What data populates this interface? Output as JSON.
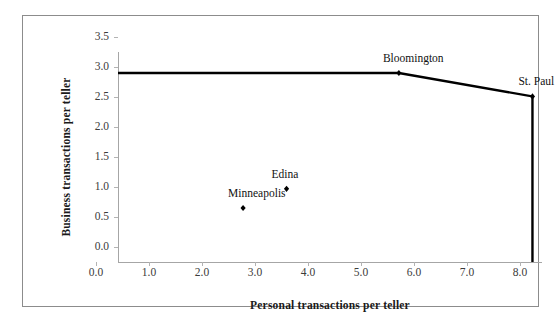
{
  "chart_data": {
    "type": "scatter",
    "title": "",
    "xlabel": "Personal transactions per teller",
    "ylabel": "Business transactions per teller",
    "xlim": [
      0.0,
      8.0
    ],
    "ylim": [
      0.0,
      3.5
    ],
    "xticks": [
      "0.0",
      "1.0",
      "2.0",
      "3.0",
      "4.0",
      "5.0",
      "6.0",
      "7.0",
      "8.0"
    ],
    "yticks": [
      "0.0",
      "0.5",
      "1.0",
      "1.5",
      "2.0",
      "2.5",
      "3.0",
      "3.5"
    ],
    "xtick_values": [
      0.0,
      1.0,
      2.0,
      3.0,
      4.0,
      5.0,
      6.0,
      7.0,
      8.0
    ],
    "ytick_values": [
      0.0,
      0.5,
      1.0,
      1.5,
      2.0,
      2.5,
      3.0,
      3.5
    ],
    "grid": false,
    "legend": "none",
    "marker_color": "#000000",
    "line_color": "#000000",
    "axis_color": "#a6a6a6",
    "border_color": "#8c8c8c",
    "points": [
      {
        "name": "Bloomington",
        "x": 5.3,
        "y": 3.15,
        "label_dx": 6,
        "label_dy": -6
      },
      {
        "name": "St. Paul",
        "x": 7.82,
        "y": 2.76,
        "label_dx": 8,
        "label_dy": -6
      },
      {
        "name": "Edina",
        "x": 3.18,
        "y": 1.22,
        "label_dx": 7,
        "label_dy": -6
      },
      {
        "name": "Minneapolis",
        "x": 2.36,
        "y": 0.9,
        "label_dx": 7,
        "label_dy": -6
      }
    ],
    "frontier": {
      "description": "Efficient frontier piecewise line from y-axis through Bloomington and St. Paul, dropping vertically to the x-axis",
      "vertices": [
        {
          "x": 0.0,
          "y": 3.15
        },
        {
          "x": 5.3,
          "y": 3.15
        },
        {
          "x": 7.82,
          "y": 2.76
        },
        {
          "x": 7.82,
          "y": 0.0
        }
      ]
    }
  }
}
